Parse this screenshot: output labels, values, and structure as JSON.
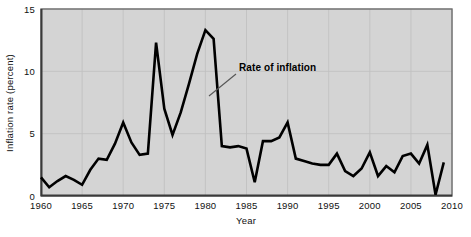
{
  "chart_data": {
    "type": "line",
    "title": "",
    "xlabel": "Year",
    "ylabel": "Inflation rate (percent)",
    "xlim": [
      1960,
      2010
    ],
    "ylim": [
      0,
      15
    ],
    "grid": true,
    "legend_position": "none",
    "xticks": [
      1960,
      1965,
      1970,
      1975,
      1980,
      1985,
      1990,
      1995,
      2000,
      2005,
      2010
    ],
    "xtick_labels": [
      "1960",
      "1965",
      "1970",
      "1975",
      "1980",
      "1985",
      "1990",
      "1995",
      "2000",
      "2005",
      "2010"
    ],
    "yticks": [
      0,
      5,
      10,
      15
    ],
    "ytick_labels": [
      "0",
      "5",
      "10",
      "15"
    ],
    "annotations": [
      {
        "text": "Rate of inflation",
        "text_x": 239,
        "text_y": 71,
        "leader_from_x": 236,
        "leader_from_y": 74,
        "leader_to_x": 209,
        "leader_to_y": 96
      }
    ],
    "series": [
      {
        "name": "Rate of inflation",
        "color": "#000000",
        "x": [
          1960,
          1961,
          1962,
          1963,
          1964,
          1965,
          1966,
          1967,
          1968,
          1969,
          1970,
          1971,
          1972,
          1973,
          1974,
          1975,
          1976,
          1977,
          1978,
          1979,
          1980,
          1981,
          1982,
          1983,
          1984,
          1985,
          1986,
          1987,
          1988,
          1989,
          1990,
          1991,
          1992,
          1993,
          1994,
          1995,
          1996,
          1997,
          1998,
          1999,
          2000,
          2001,
          2002,
          2003,
          2004,
          2005,
          2006,
          2007,
          2008,
          2009
        ],
        "values": [
          1.5,
          0.7,
          1.2,
          1.6,
          1.3,
          0.9,
          2.1,
          3.0,
          2.9,
          4.2,
          5.9,
          4.3,
          3.3,
          3.4,
          12.3,
          7.0,
          4.9,
          6.7,
          9.0,
          11.4,
          13.3,
          12.6,
          4.0,
          3.9,
          4.0,
          3.8,
          1.1,
          4.4,
          4.4,
          4.7,
          5.9,
          3.0,
          2.8,
          2.6,
          2.5,
          2.5,
          3.4,
          2.0,
          1.6,
          2.2,
          3.5,
          1.6,
          2.4,
          1.9,
          3.2,
          3.4,
          2.6,
          4.1,
          0.1,
          2.7
        ]
      }
    ]
  },
  "styling": {
    "plot_background": "#d4d4d4",
    "grid_color": "#bfbfbf",
    "axis_color": "#5a5a5a",
    "line_color": "#000000",
    "text_color": "#111111"
  }
}
